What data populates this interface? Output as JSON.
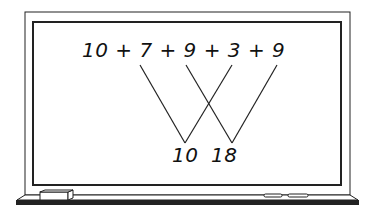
{
  "board": {
    "expression": "10 + 7 + 9 + 3 + 9",
    "terms": [
      "10",
      "7",
      "9",
      "3",
      "9"
    ],
    "sums": [
      {
        "value": "10",
        "pair": [
          "7",
          "3"
        ]
      },
      {
        "value": "18",
        "pair": [
          "9",
          "9"
        ]
      }
    ],
    "sum_left": "10",
    "sum_right": "18"
  },
  "colors": {
    "ink": "#111111",
    "board": "#ffffff",
    "tray": "#222222"
  }
}
